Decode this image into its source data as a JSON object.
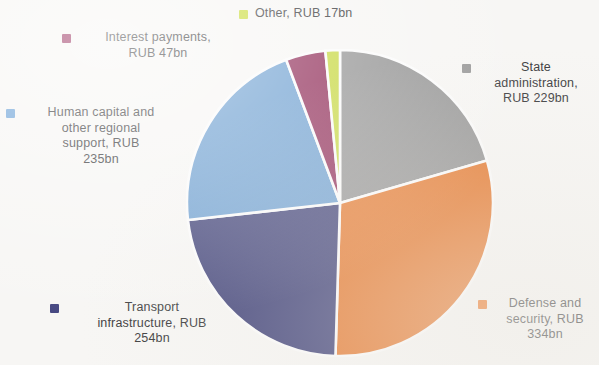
{
  "chart_data": {
    "type": "pie",
    "title": "",
    "subtitle": "",
    "unit": "RUB bn",
    "currency": "RUB",
    "total": 1116,
    "legend_position": "around-slices",
    "grid": false,
    "start_angle_deg": 0,
    "direction": "clockwise",
    "categories": [
      "State administration",
      "Defense and security",
      "Transport infrastructure",
      "Human capital and other regional support",
      "Interest payments",
      "Other"
    ],
    "values": [
      229,
      334,
      254,
      235,
      47,
      17
    ],
    "labels": [
      "State administration, RUB 229bn",
      "Defense and security, RUB 334bn",
      "Transport infrastructure, RUB 254bn",
      "Human capital and other regional support, RUB 235bn",
      "Interest payments, RUB 47bn",
      "Other, RUB 17bn"
    ],
    "colors": [
      "#9a9a9a",
      "#ee7d2f",
      "#43457f",
      "#70a4d8",
      "#99305e",
      "#cbdc3f"
    ],
    "slices": [
      {
        "name": "State administration",
        "value": 229,
        "unit_label": "RUB 229bn",
        "color": "#9a9a9a",
        "percent": 20.5,
        "start_deg": 0.0,
        "end_deg": 73.9
      },
      {
        "name": "Defense and security",
        "value": 334,
        "unit_label": "RUB 334bn",
        "color": "#ee7d2f",
        "percent": 29.9,
        "start_deg": 73.9,
        "end_deg": 181.7
      },
      {
        "name": "Transport infrastructure",
        "value": 254,
        "unit_label": "RUB 254bn",
        "color": "#43457f",
        "percent": 22.8,
        "start_deg": 181.7,
        "end_deg": 263.6
      },
      {
        "name": "Human capital and other regional support",
        "value": 235,
        "unit_label": "RUB 235bn",
        "color": "#70a4d8",
        "percent": 21.1,
        "start_deg": 263.6,
        "end_deg": 339.4
      },
      {
        "name": "Interest payments",
        "value": 47,
        "unit_label": "RUB 47bn",
        "color": "#99305e",
        "percent": 4.2,
        "start_deg": 339.4,
        "end_deg": 354.5
      },
      {
        "name": "Other",
        "value": 17,
        "unit_label": "RUB 17bn",
        "color": "#cbdc3f",
        "percent": 1.5,
        "start_deg": 354.5,
        "end_deg": 360.0
      }
    ]
  },
  "legend": {
    "items": [
      {
        "id": "other",
        "label": "Other, RUB 17bn",
        "color": "#cbdc3f"
      },
      {
        "id": "interest",
        "label": "Interest payments,\nRUB 47bn",
        "color": "#99305e"
      },
      {
        "id": "human",
        "label": "Human capital and\nother regional\nsupport, RUB\n235bn",
        "color": "#70a4d8"
      },
      {
        "id": "state",
        "label": "State\nadministration,\nRUB 229bn",
        "color": "#9a9a9a"
      },
      {
        "id": "defense",
        "label": "Defense and\nsecurity, RUB\n334bn",
        "color": "#ee7d2f"
      },
      {
        "id": "transport",
        "label": "Transport\ninfrastructure, RUB\n254bn",
        "color": "#43457f"
      }
    ]
  },
  "canvas": {
    "background_color": "#f7f6f4",
    "separator_color": "#ffffff"
  }
}
